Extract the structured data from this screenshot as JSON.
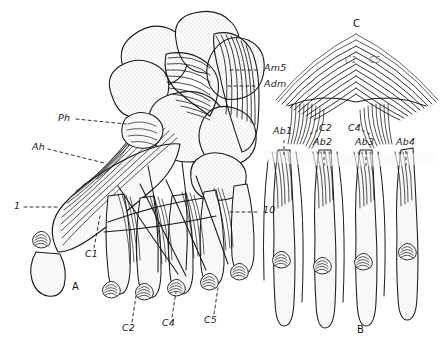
{
  "figure": {
    "background_color": "#ffffff",
    "ink_color": "#1a1a1a",
    "stipple_color": "#9a9a9a",
    "width": 444,
    "height": 353
  },
  "panels": [
    {
      "id": "A",
      "label": "A",
      "x": 72,
      "y": 283,
      "description": "plantar view of foot with intrinsic muscles"
    },
    {
      "id": "B",
      "label": "B",
      "x": 357,
      "y": 326,
      "description": "isolated digits with abductor muscles"
    },
    {
      "id": "C",
      "label": "C",
      "x": 353,
      "y": 20,
      "description": "fan shaped aponeurosis / tendon sheet"
    }
  ],
  "labels": [
    {
      "name": "label-am5",
      "text": "Am5",
      "x": 264,
      "y": 68,
      "leader": "dash-left",
      "style": "italic"
    },
    {
      "name": "label-adm",
      "text": "Adm",
      "x": 264,
      "y": 84,
      "leader": "dash-left",
      "style": "italic"
    },
    {
      "name": "label-ph",
      "text": "Ph",
      "x": 58,
      "y": 118,
      "leader": "dash-right",
      "style": "italic"
    },
    {
      "name": "label-ah",
      "text": "Ah",
      "x": 32,
      "y": 147,
      "leader": "dash-right",
      "style": "italic"
    },
    {
      "name": "label-1",
      "text": "1",
      "x": 14,
      "y": 206,
      "leader": "dash-right",
      "style": "italic"
    },
    {
      "name": "label-10",
      "text": "10",
      "x": 262,
      "y": 209,
      "leader": "dash-left",
      "style": "italic"
    },
    {
      "name": "label-c1-a",
      "text": "C1",
      "x": 86,
      "y": 254,
      "leader": "dash-up",
      "style": "italic"
    },
    {
      "name": "label-c2-a",
      "text": "C2",
      "x": 122,
      "y": 328,
      "leader": "dash-up",
      "style": "italic"
    },
    {
      "name": "label-c4-a",
      "text": "C4",
      "x": 162,
      "y": 323,
      "leader": "dash-up",
      "style": "italic"
    },
    {
      "name": "label-c5-a",
      "text": "C5",
      "x": 204,
      "y": 320,
      "leader": "dash-up",
      "style": "italic"
    },
    {
      "name": "label-ab1",
      "text": "Ab1",
      "x": 274,
      "y": 130,
      "leader": "dash-down",
      "style": "italic"
    },
    {
      "name": "label-c2-c",
      "text": "C2",
      "x": 320,
      "y": 127,
      "leader": "dash-left",
      "style": "italic"
    },
    {
      "name": "label-c4-c",
      "text": "C4",
      "x": 349,
      "y": 127,
      "leader": "dash-right",
      "style": "italic"
    },
    {
      "name": "label-ab2",
      "text": "Ab2",
      "x": 315,
      "y": 141,
      "leader": "dash-down",
      "style": "italic"
    },
    {
      "name": "label-ab3",
      "text": "Ab3",
      "x": 357,
      "y": 141,
      "leader": "dash-down",
      "style": "italic"
    },
    {
      "name": "label-ab4",
      "text": "Ab4",
      "x": 397,
      "y": 141,
      "leader": "dash-down",
      "style": "italic"
    },
    {
      "name": "label-c1-c",
      "text": "C1",
      "x": 346,
      "y": 58,
      "leader": "none",
      "style": "faint"
    },
    {
      "name": "label-c5-c",
      "text": "C5",
      "x": 370,
      "y": 58,
      "leader": "none",
      "style": "faint"
    }
  ],
  "legend_keys": [
    "Am5",
    "Adm",
    "Ph",
    "Ah",
    "Ab1",
    "Ab2",
    "Ab3",
    "Ab4",
    "C1",
    "C2",
    "C4",
    "C5",
    "1",
    "10"
  ]
}
